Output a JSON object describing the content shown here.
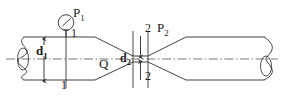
{
  "diagram": {
    "type": "engineering-line-drawing",
    "stroke_color": "#2b2b2b",
    "centerline_color": "#555555",
    "background": "#ffffff",
    "labels": {
      "pressure_1": "P",
      "pressure_1_sub": "1",
      "pressure_2": "P",
      "pressure_2_sub": "2",
      "diameter_1": "d",
      "diameter_1_sub": "1",
      "diameter_2": "d",
      "diameter_2_sub": "2",
      "flow_rate": "Q",
      "section_1_upper": "1",
      "section_1_lower": "1",
      "section_2_upper": "2",
      "section_2_lower": "2"
    },
    "components": {
      "gauge": "pressure-gauge",
      "inlet_pipe": "large-diameter-inlet",
      "converging_cone": "converging-section",
      "throat": "venturi-throat",
      "diverging_cone": "diverging-section",
      "outlet_pipe": "large-diameter-outlet",
      "break_left": "pipe-break-symbol-left",
      "break_right": "pipe-break-symbol-right",
      "centerline": "axis-centerline",
      "dim_d1": "diameter-dimension-d1",
      "dim_d2": "diameter-dimension-d2",
      "section_line_1": "section-line-1-1",
      "section_line_2a": "section-line-2-left",
      "section_line_2b": "section-line-2-right"
    }
  }
}
